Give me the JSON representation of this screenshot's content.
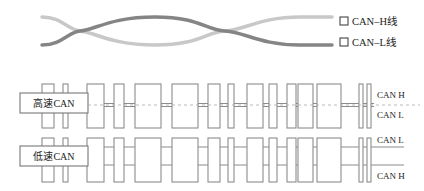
{
  "legend": {
    "items": [
      {
        "label": "CAN–H线",
        "color": "#8a8a8a"
      },
      {
        "label": "CAN–L线",
        "color": "#c8c8c8"
      }
    ]
  },
  "wave": {
    "light_color": "#c8c8c8",
    "dark_color": "#858585"
  },
  "high_speed": {
    "label": "高速CAN",
    "line_top": "CAN H",
    "line_bottom": "CAN L"
  },
  "low_speed": {
    "label": "低速CAN",
    "line_top": "CAN L",
    "line_bottom": "CAN H"
  },
  "colors": {
    "box_stroke": "#8c8c8c",
    "wire": "#8c8c8c",
    "dash": "#aaaaaa"
  }
}
